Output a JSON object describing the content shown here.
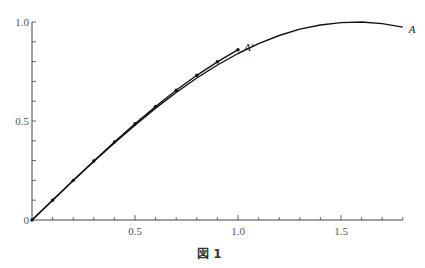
{
  "chart_data": {
    "type": "line",
    "title": "",
    "caption": "図 1",
    "xlabel": "",
    "ylabel": "",
    "xlim": [
      0,
      1.8
    ],
    "ylim": [
      0,
      1.0
    ],
    "x_ticks": [
      0.1,
      0.2,
      0.3,
      0.4,
      0.5,
      0.6,
      0.7,
      0.8,
      0.9,
      1.0,
      1.1,
      1.2,
      1.3,
      1.4,
      1.5,
      1.6,
      1.7,
      1.8
    ],
    "x_tick_labels": [
      {
        "value": 0.5,
        "label": "0.5"
      },
      {
        "value": 1.0,
        "label": "1.0"
      },
      {
        "value": 1.5,
        "label": "1.5"
      }
    ],
    "y_ticks": [
      0.1,
      0.2,
      0.3,
      0.4,
      0.5,
      0.6,
      0.7,
      0.8,
      0.9,
      1.0
    ],
    "y_tick_labels": [
      {
        "value": 0,
        "label": "0"
      },
      {
        "value": 0.5,
        "label": "0.5"
      },
      {
        "value": 1.0,
        "label": "1.0"
      }
    ],
    "grid": false,
    "legend": "none (curves labeled inline)",
    "series": [
      {
        "name": "A",
        "label": "A",
        "style": "smooth curve",
        "x": [
          0,
          0.1,
          0.2,
          0.3,
          0.4,
          0.5,
          0.6,
          0.7,
          0.8,
          0.9,
          1.0,
          1.1,
          1.2,
          1.3,
          1.4,
          1.5,
          1.6,
          1.7,
          1.8
        ],
        "values": [
          0,
          0.1,
          0.199,
          0.296,
          0.389,
          0.479,
          0.565,
          0.644,
          0.717,
          0.783,
          0.841,
          0.891,
          0.932,
          0.964,
          0.985,
          0.997,
          1.0,
          0.992,
          0.974
        ]
      },
      {
        "name": "A'",
        "label": "A′",
        "style": "polyline with dot markers",
        "x": [
          0,
          0.1,
          0.2,
          0.3,
          0.4,
          0.5,
          0.6,
          0.7,
          0.8,
          0.9,
          1.0
        ],
        "values": [
          0,
          0.1,
          0.2,
          0.298,
          0.394,
          0.486,
          0.573,
          0.655,
          0.731,
          0.799,
          0.86
        ]
      }
    ]
  },
  "caption": "図 1"
}
